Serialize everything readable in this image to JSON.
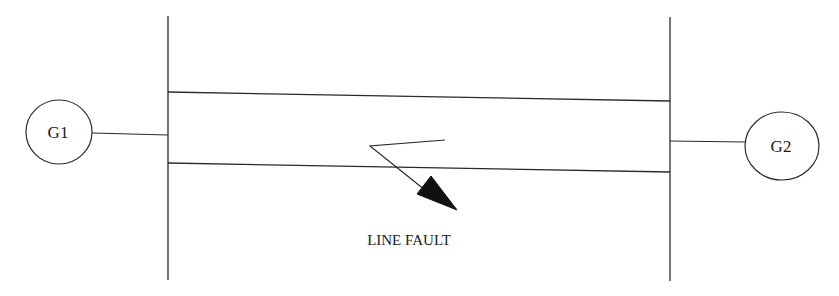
{
  "diagram": {
    "type": "single-line power system diagram",
    "generators": [
      {
        "id": "g1",
        "label": "G1",
        "side": "left"
      },
      {
        "id": "g2",
        "label": "G2",
        "side": "right"
      }
    ],
    "buses": [
      "left-bus",
      "right-bus"
    ],
    "lines": [
      "transmission-line-1",
      "transmission-line-2"
    ],
    "fault": {
      "label": "LINE FAULT",
      "location": "transmission-line-2"
    }
  },
  "colors": {
    "stroke": "#2a2a2a",
    "background": "#ffffff"
  }
}
